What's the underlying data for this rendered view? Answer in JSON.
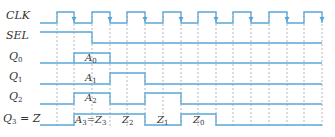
{
  "signals": [
    {
      "name": "CLK",
      "label_main": "CLK",
      "label_sub": ""
    },
    {
      "name": "SEL",
      "label_main": "SEL",
      "label_sub": ""
    },
    {
      "name": "Q0",
      "label_main": "Q",
      "label_sub": "0"
    },
    {
      "name": "Q1",
      "label_main": "Q",
      "label_sub": "1"
    },
    {
      "name": "Q2",
      "label_main": "Q",
      "label_sub": "2"
    },
    {
      "name": "Q3",
      "label_main": "Q",
      "label_sub": "3",
      "label_suffix": " = Z"
    }
  ],
  "annotations": {
    "q0_a0": {
      "main": "A",
      "sub": "0"
    },
    "q1_a1": {
      "main": "A",
      "sub": "1"
    },
    "q2_a2": {
      "main": "A",
      "sub": "2"
    },
    "q3_a3": {
      "main": "A",
      "sub": "3",
      "eq": "=",
      "main2": "Z",
      "sub2": "3"
    },
    "z2": {
      "main": "Z",
      "sub": "2"
    },
    "z1": {
      "main": "Z",
      "sub": "1"
    },
    "z0": {
      "main": "Z",
      "sub": "0"
    }
  },
  "colors": {
    "wave": "#5aa6d8",
    "grid": "#9a9a9a",
    "text": "#333333"
  },
  "clock": {
    "rising_edges_x": [
      57,
      92,
      127,
      163,
      198,
      233,
      269,
      304
    ],
    "falling_edges_x": [
      74,
      110,
      145,
      181,
      216,
      251,
      287,
      322
    ]
  }
}
